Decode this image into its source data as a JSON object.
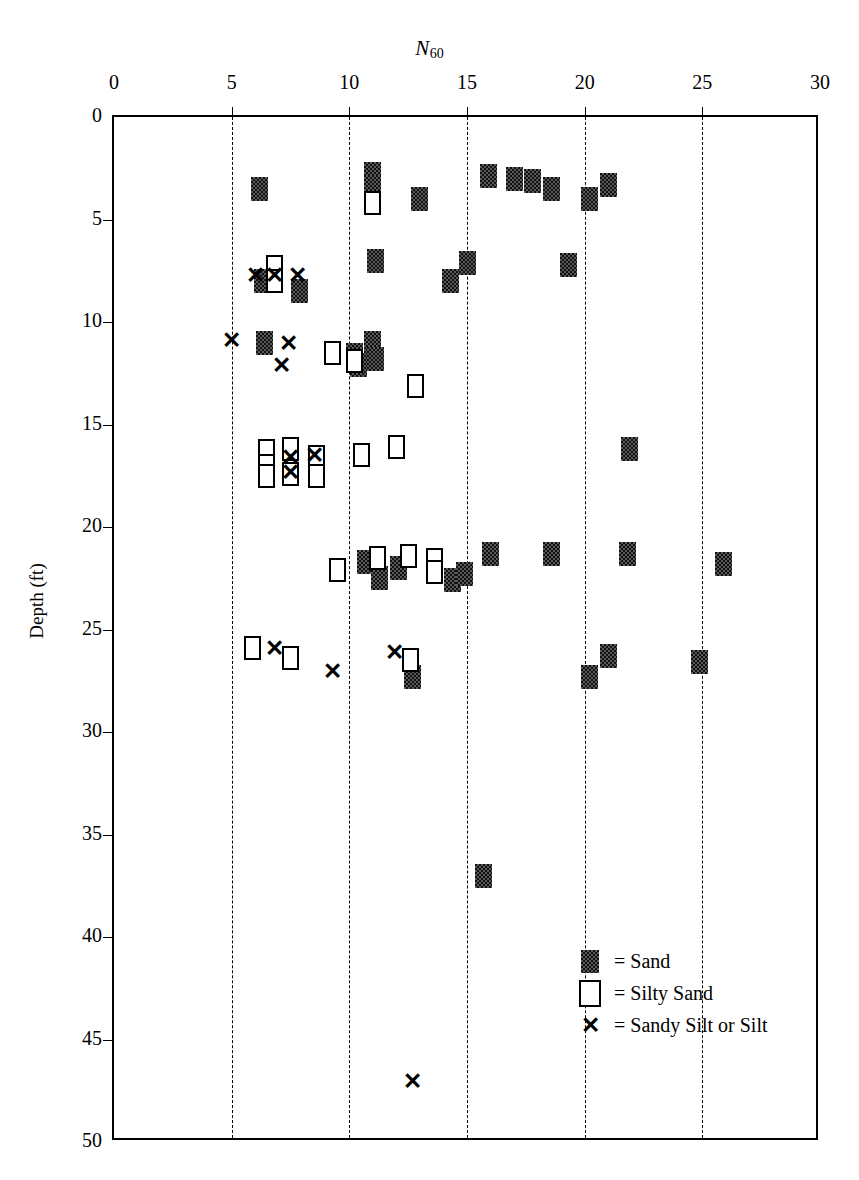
{
  "chart_data": {
    "type": "scatter",
    "title": "N60",
    "xlabel": "N_60",
    "ylabel": "Depth (ft)",
    "xlim": [
      0,
      30
    ],
    "ylim": [
      0,
      50
    ],
    "y_inverted": true,
    "x_ticks": [
      0,
      5,
      10,
      15,
      20,
      25,
      30
    ],
    "y_ticks": [
      0,
      5,
      10,
      15,
      20,
      25,
      30,
      35,
      40,
      45,
      50
    ],
    "gridlines": "vertical dashed at x = 5, 10, 15, 20, 25",
    "x_axis_position": "top",
    "legend_position": "bottom-right",
    "legend": [
      {
        "key": "sand",
        "symbol": "filled-square",
        "label": "= Sand"
      },
      {
        "key": "silty_sand",
        "symbol": "open-square",
        "label": "= Silty Sand"
      },
      {
        "key": "sandy_silt",
        "symbol": "x-mark",
        "label": "= Sandy Silt or Silt"
      }
    ],
    "series": [
      {
        "name": "Sand",
        "symbol": "filled-square",
        "points": [
          [
            6.2,
            3.5
          ],
          [
            11.0,
            2.8
          ],
          [
            11.0,
            3.4
          ],
          [
            13.0,
            4.0
          ],
          [
            15.9,
            2.9
          ],
          [
            17.0,
            3.0
          ],
          [
            17.8,
            3.1
          ],
          [
            18.6,
            3.5
          ],
          [
            20.2,
            4.0
          ],
          [
            21.0,
            3.3
          ],
          [
            6.3,
            8.0
          ],
          [
            7.9,
            8.5
          ],
          [
            11.1,
            7.0
          ],
          [
            14.3,
            8.0
          ],
          [
            15.0,
            7.1
          ],
          [
            19.3,
            7.2
          ],
          [
            6.4,
            11.0
          ],
          [
            11.0,
            11.0
          ],
          [
            11.1,
            11.8
          ],
          [
            10.2,
            11.6
          ],
          [
            10.4,
            12.1
          ],
          [
            21.9,
            16.2
          ],
          [
            10.7,
            21.7
          ],
          [
            11.3,
            22.5
          ],
          [
            12.1,
            22.0
          ],
          [
            14.4,
            22.6
          ],
          [
            14.9,
            22.3
          ],
          [
            16.0,
            21.3
          ],
          [
            18.6,
            21.3
          ],
          [
            21.8,
            21.3
          ],
          [
            25.9,
            21.8
          ],
          [
            12.7,
            27.3
          ],
          [
            20.2,
            27.3
          ],
          [
            21.0,
            26.3
          ],
          [
            24.9,
            26.6
          ],
          [
            15.7,
            37.0
          ]
        ]
      },
      {
        "name": "Silty Sand",
        "symbol": "open-square",
        "points": [
          [
            11.0,
            4.2
          ],
          [
            6.8,
            7.3
          ],
          [
            6.8,
            8.0
          ],
          [
            9.3,
            11.5
          ],
          [
            10.2,
            11.9
          ],
          [
            12.8,
            13.1
          ],
          [
            6.5,
            16.3
          ],
          [
            6.5,
            17.0
          ],
          [
            6.5,
            17.5
          ],
          [
            7.5,
            16.2
          ],
          [
            7.5,
            17.4
          ],
          [
            8.6,
            16.6
          ],
          [
            8.6,
            17.5
          ],
          [
            10.5,
            16.5
          ],
          [
            12.0,
            16.1
          ],
          [
            9.5,
            22.1
          ],
          [
            11.2,
            21.5
          ],
          [
            12.5,
            21.4
          ],
          [
            13.6,
            21.6
          ],
          [
            13.6,
            22.2
          ],
          [
            5.9,
            25.9
          ],
          [
            7.5,
            26.4
          ],
          [
            12.6,
            26.5
          ]
        ]
      },
      {
        "name": "Sandy Silt or Silt",
        "symbol": "x-mark",
        "points": [
          [
            6.0,
            7.7
          ],
          [
            6.8,
            7.7
          ],
          [
            7.8,
            7.7
          ],
          [
            5.0,
            10.9
          ],
          [
            7.4,
            11.0
          ],
          [
            7.1,
            12.1
          ],
          [
            7.5,
            16.6
          ],
          [
            7.5,
            17.3
          ],
          [
            8.5,
            16.5
          ],
          [
            6.8,
            25.9
          ],
          [
            9.3,
            27.0
          ],
          [
            11.9,
            26.1
          ],
          [
            12.7,
            47.0
          ]
        ]
      }
    ]
  },
  "axes": {
    "x_title_main": "N",
    "x_title_sub": "60",
    "y_title": "Depth (ft)",
    "x_labels": [
      "0",
      "5",
      "10",
      "15",
      "20",
      "25",
      "30"
    ],
    "y_labels": [
      "0",
      "5",
      "10",
      "15",
      "20",
      "25",
      "30",
      "35",
      "40",
      "45",
      "50"
    ]
  },
  "legend": {
    "sand": "= Sand",
    "silty_sand": "= Silty Sand",
    "sandy_silt": "= Sandy Silt or Silt",
    "x_glyph": "✕"
  }
}
